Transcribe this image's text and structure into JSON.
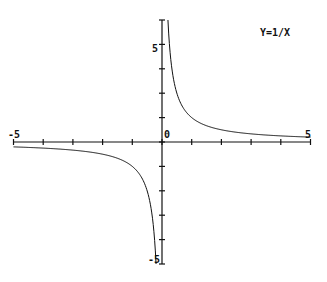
{
  "chart_data": {
    "type": "line",
    "title": "Y=1/X",
    "xlabel": "",
    "ylabel": "",
    "xlim": [
      -5,
      5
    ],
    "ylim": [
      -5,
      5
    ],
    "grid": false,
    "legend": null,
    "tick_labels": {
      "x_min": "-5",
      "x_max": "5",
      "origin": "0",
      "y_max": "5",
      "y_min": "-5"
    },
    "x_ticks": [
      -5,
      -4,
      -3,
      -2,
      -1,
      0,
      1,
      2,
      3,
      4,
      5
    ],
    "y_ticks": [
      -5,
      -4,
      -3,
      -2,
      -1,
      0,
      1,
      2,
      3,
      4,
      5
    ],
    "series": [
      {
        "name": "Y=1/X",
        "function": "1/x",
        "x": [
          -5,
          -4,
          -3,
          -2,
          -1.5,
          -1,
          -0.75,
          -0.5,
          -0.4,
          -0.3,
          -0.25,
          -0.2,
          0.2,
          0.25,
          0.3,
          0.4,
          0.5,
          0.75,
          1,
          1.5,
          2,
          3,
          4,
          5
        ],
        "y": [
          -0.2,
          -0.25,
          -0.333,
          -0.5,
          -0.667,
          -1,
          -1.333,
          -2,
          -2.5,
          -3.333,
          -4,
          -5,
          5,
          4,
          3.333,
          2.5,
          2,
          1.333,
          1,
          0.667,
          0.5,
          0.333,
          0.25,
          0.2
        ]
      }
    ]
  }
}
